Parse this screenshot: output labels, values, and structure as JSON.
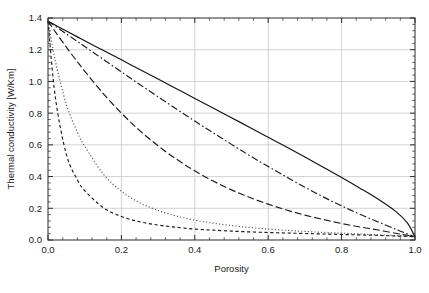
{
  "chart_data": {
    "type": "line",
    "title": "",
    "xlabel": "Porosity",
    "ylabel": "Thermal conductivity [W/Km]",
    "xlim": [
      0.0,
      1.0
    ],
    "ylim": [
      0.0,
      1.4
    ],
    "xticks": [
      "0.0",
      "0.2",
      "0.4",
      "0.6",
      "0.8",
      "1.0"
    ],
    "xtick_values": [
      0.0,
      0.2,
      0.4,
      0.6,
      0.8,
      1.0
    ],
    "yticks": [
      "0.0",
      "0.2",
      "0.4",
      "0.6",
      "0.8",
      "1.0",
      "1.2",
      "1.4"
    ],
    "ytick_values": [
      0.0,
      0.2,
      0.4,
      0.6,
      0.8,
      1.0,
      1.2,
      1.4
    ],
    "minor_tick_count": 4,
    "grid": true,
    "grid_color": "#c8c8c8",
    "frame_color": "#2b2b2b",
    "legend": "none",
    "legend_position": "none",
    "annotations": [],
    "x": [
      0.0,
      0.02,
      0.05,
      0.08,
      0.1,
      0.15,
      0.2,
      0.25,
      0.3,
      0.35,
      0.4,
      0.45,
      0.5,
      0.55,
      0.6,
      0.65,
      0.7,
      0.75,
      0.8,
      0.85,
      0.9,
      0.95,
      0.98,
      1.0
    ],
    "series": [
      {
        "name": "curve-1-solid",
        "style": "solid",
        "color": "#111111",
        "values": [
          1.38,
          1.355,
          1.318,
          1.281,
          1.257,
          1.196,
          1.136,
          1.075,
          1.015,
          0.954,
          0.893,
          0.832,
          0.771,
          0.71,
          0.648,
          0.586,
          0.523,
          0.459,
          0.394,
          0.327,
          0.257,
          0.176,
          0.105,
          0.02
        ]
      },
      {
        "name": "curve-2-dashdot",
        "style": "dashdot",
        "color": "#1b1b1b",
        "values": [
          1.38,
          1.348,
          1.3,
          1.252,
          1.22,
          1.14,
          1.06,
          0.981,
          0.903,
          0.826,
          0.75,
          0.676,
          0.603,
          0.532,
          0.463,
          0.397,
          0.333,
          0.272,
          0.215,
          0.162,
          0.114,
          0.065,
          0.038,
          0.02
        ]
      },
      {
        "name": "curve-3-longdash",
        "style": "longdash",
        "color": "#1b1b1b",
        "values": [
          1.38,
          1.313,
          1.216,
          1.124,
          1.065,
          0.925,
          0.8,
          0.69,
          0.594,
          0.51,
          0.436,
          0.372,
          0.316,
          0.268,
          0.226,
          0.189,
          0.157,
          0.129,
          0.104,
          0.082,
          0.063,
          0.041,
          0.03,
          0.02
        ]
      },
      {
        "name": "curve-4-dotted",
        "style": "dotted",
        "color": "#4d4d4d",
        "values": [
          1.38,
          1.13,
          0.855,
          0.68,
          0.592,
          0.418,
          0.307,
          0.235,
          0.186,
          0.151,
          0.125,
          0.106,
          0.091,
          0.079,
          0.069,
          0.061,
          0.054,
          0.048,
          0.043,
          0.038,
          0.033,
          0.027,
          0.024,
          0.02
        ]
      },
      {
        "name": "curve-5-shortdash",
        "style": "shortdash",
        "color": "#1b1b1b",
        "values": [
          1.38,
          0.9,
          0.54,
          0.38,
          0.312,
          0.205,
          0.148,
          0.115,
          0.094,
          0.08,
          0.069,
          0.062,
          0.056,
          0.051,
          0.047,
          0.044,
          0.041,
          0.038,
          0.035,
          0.032,
          0.029,
          0.025,
          0.023,
          0.02
        ]
      }
    ]
  }
}
